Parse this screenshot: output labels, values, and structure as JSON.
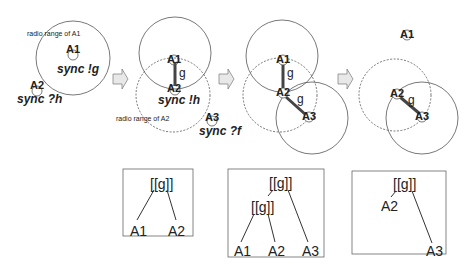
{
  "panels": [
    {
      "id": "stage1",
      "range_label": "radio range of  A1",
      "nodes": [
        {
          "name": "A1",
          "action": "sync !g"
        },
        {
          "name": "A2",
          "action": "sync ?h"
        }
      ]
    },
    {
      "id": "stage2",
      "range_label": "radio range of A2",
      "nodes": [
        {
          "name": "A1"
        },
        {
          "name": "A2",
          "action": "sync !h"
        },
        {
          "name": "A3",
          "action": "sync ?f"
        }
      ],
      "edge_label": "g"
    },
    {
      "id": "stage3",
      "nodes": [
        {
          "name": "A1"
        },
        {
          "name": "A2"
        },
        {
          "name": "A3"
        }
      ],
      "edge_labels": [
        "g",
        "g"
      ]
    },
    {
      "id": "stage4",
      "nodes": [
        {
          "name": "A1"
        },
        {
          "name": "A2"
        },
        {
          "name": "A3"
        }
      ],
      "edge_label": "g"
    }
  ],
  "trees": [
    {
      "root": "[[g]]",
      "leaves": [
        "A1",
        "A2"
      ]
    },
    {
      "root": "[[g]]",
      "inner": "[[g]]",
      "leaves": [
        "A1",
        "A2",
        "A3"
      ]
    },
    {
      "root": "[[g]]",
      "leaves": [
        "A2",
        "A3"
      ]
    }
  ],
  "colors": {
    "stroke": "#555555",
    "arrow_fill": "#e8e8e8",
    "edge": "#444444"
  }
}
